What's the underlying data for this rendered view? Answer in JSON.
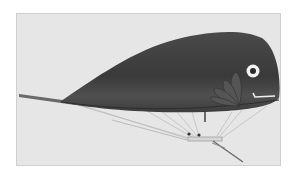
{
  "image": {
    "subject": "Fish-shaped airship",
    "description": "Vintage monochrome photograph of a whale/fish-shaped dirigible balloon with painted eye, mouth and fins, a long tail pole, and a small gondola suspended below by rigging lines",
    "colors": {
      "background": "#ffffff",
      "photo_bg": "#e6e6e6",
      "body_dark": "#3e3e3e",
      "body_mid": "#555555",
      "fin": "#505050",
      "eye_white": "#f2f2f2",
      "eye_pupil": "#2a2a2a",
      "rigging": "#bdbdbd",
      "gondola": "#d8d8d8"
    }
  }
}
